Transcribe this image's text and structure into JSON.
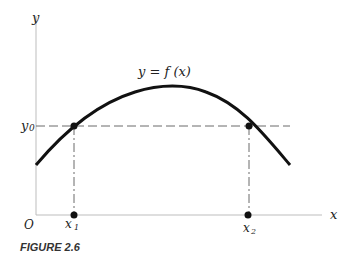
{
  "figure": {
    "caption": "FIGURE 2.6",
    "curve_label": "y = f (x)",
    "axis_labels": {
      "x": "x",
      "y": "y",
      "origin": "O"
    },
    "y_level_label": {
      "base": "y",
      "sub": "0"
    },
    "points": [
      {
        "label_base": "x",
        "label_sub": "1"
      },
      {
        "label_base": "x",
        "label_sub": "2"
      }
    ],
    "colors": {
      "curve": "#111111",
      "axes": "#b8b8b8",
      "dashed": "#666666",
      "points": "#111111"
    }
  }
}
